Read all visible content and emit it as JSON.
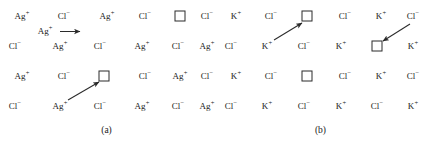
{
  "figure": {
    "background": "#ffffff",
    "ink_color": "#1a1a1a",
    "arrow_color": "#2b2b2b"
  },
  "panels": [
    {
      "id": "a",
      "caption": "(a)",
      "cation_label": "Ag",
      "cation_charge": "+",
      "anion_label": "Cl",
      "anion_charge": "−",
      "rows": [
        {
          "row_index": 1,
          "cells": [
            "Ag+",
            "Cl-",
            "Ag+",
            "Cl-",
            "vacancy",
            "Cl-"
          ]
        },
        {
          "row_index": 2,
          "cells": [
            "Cl-",
            "Ag+",
            "Cl-",
            "Ag+",
            "Cl-",
            "Ag+"
          ]
        },
        {
          "row_index": 3,
          "cells": [
            "Ag+",
            "Cl-",
            "vacancy",
            "Cl-",
            "Ag+",
            "Cl-"
          ]
        },
        {
          "row_index": 4,
          "cells": [
            "Cl-",
            "Ag+",
            "Cl-",
            "Ag+",
            "Cl-",
            "Ag+"
          ]
        }
      ],
      "migrating_species_label": "Ag",
      "migrating_species_charge": "+",
      "arrows": [
        {
          "name": "interstitial-hop-arrow",
          "direction": "right",
          "style": "horizontal"
        },
        {
          "name": "vacancy-hop-arrow",
          "direction": "up-right",
          "style": "diagonal"
        }
      ]
    },
    {
      "id": "b",
      "caption": "(b)",
      "cation_label": "K",
      "cation_charge": "+",
      "anion_label": "Cl",
      "anion_charge": "−",
      "rows": [
        {
          "row_index": 1,
          "cells": [
            "K+",
            "Cl-",
            "vacancy",
            "Cl-",
            "K+",
            "Cl-"
          ]
        },
        {
          "row_index": 2,
          "cells": [
            "Cl-",
            "K+",
            "Cl-",
            "K+",
            "vacancy",
            "K+"
          ]
        },
        {
          "row_index": 3,
          "cells": [
            "K+",
            "Cl-",
            "vacancy",
            "Cl-",
            "K+",
            "Cl-"
          ]
        },
        {
          "row_index": 4,
          "cells": [
            "Cl-",
            "K+",
            "Cl-",
            "K+",
            "Cl-",
            "K+"
          ]
        }
      ],
      "arrows": [
        {
          "name": "cation-vacancy-hop-arrow",
          "direction": "up-right",
          "style": "diagonal"
        },
        {
          "name": "anion-vacancy-hop-arrow",
          "direction": "down-left",
          "style": "diagonal"
        }
      ]
    }
  ],
  "species": {
    "Ag+": {
      "symbol": "Ag",
      "charge": "+"
    },
    "Cl-": {
      "symbol": "Cl",
      "charge": "−"
    },
    "K+": {
      "symbol": "K",
      "charge": "+"
    },
    "vacancy": {
      "symbol": "",
      "charge": ""
    }
  }
}
